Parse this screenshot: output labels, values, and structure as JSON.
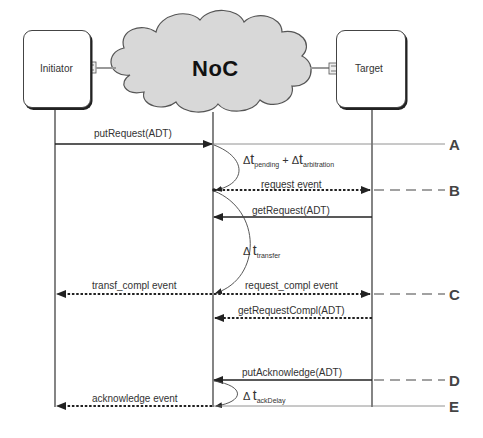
{
  "participants": {
    "initiator": "Initiator",
    "noc": "NoC",
    "target": "Target"
  },
  "messages": [
    {
      "id": "putRequest",
      "label": "putRequest(ADT)",
      "from": "Initiator",
      "to": "NoC",
      "style": "solid"
    },
    {
      "id": "request_event",
      "label": "request event",
      "from": "NoC",
      "to": "Target",
      "style": "dotted"
    },
    {
      "id": "getRequest",
      "label": "getRequest(ADT)",
      "from": "Target",
      "to": "NoC",
      "style": "solid"
    },
    {
      "id": "transf_compl_event",
      "label": "transf_compl event",
      "from": "NoC",
      "to": "Initiator",
      "style": "dotted"
    },
    {
      "id": "request_compl_event",
      "label": "request_compl event",
      "from": "NoC",
      "to": "Target",
      "style": "dotted"
    },
    {
      "id": "getRequestCompl",
      "label": "getRequestCompl(ADT)",
      "from": "Target",
      "to": "NoC",
      "style": "dotted"
    },
    {
      "id": "putAcknowledge",
      "label": "putAcknowledge(ADT)",
      "from": "Target",
      "to": "NoC",
      "style": "solid"
    },
    {
      "id": "acknowledge_event",
      "label": "acknowledge event",
      "from": "NoC",
      "to": "Initiator",
      "style": "dotted"
    }
  ],
  "delays": {
    "pending": {
      "delta": "Δ",
      "t": "t",
      "sub": "pending",
      "plus": "+"
    },
    "arbitration": {
      "delta": "Δ",
      "t": "t",
      "sub": "arbitration"
    },
    "transfer": {
      "delta": "Δ",
      "t": "t",
      "sub": "transfer"
    },
    "ackDelay": {
      "delta": "Δ",
      "t": "t",
      "sub": "ackDelay"
    }
  },
  "markers": [
    "A",
    "B",
    "C",
    "D",
    "E"
  ]
}
